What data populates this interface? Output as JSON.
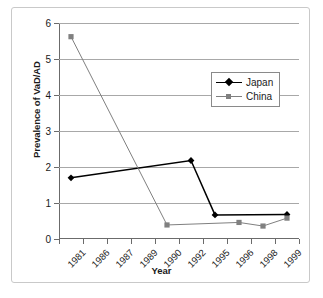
{
  "chart_data": {
    "type": "line",
    "title": "",
    "xlabel": "Year",
    "ylabel": "Prevalence of VaD/AD",
    "categories": [
      "1981",
      "1986",
      "1987",
      "1989",
      "1990",
      "1992",
      "1995",
      "1996",
      "1998",
      "1999"
    ],
    "ylim": [
      0,
      6
    ],
    "yticks": [
      "0",
      "1",
      "2",
      "3",
      "4",
      "5",
      "6"
    ],
    "grid": true,
    "legend_position": "upper-right-inside",
    "series": [
      {
        "name": "Japan",
        "marker": "diamond",
        "color": "#000000",
        "points": [
          {
            "x": "1981",
            "y": 1.7
          },
          {
            "x": "1992",
            "y": 2.18
          },
          {
            "x": "1995",
            "y": 0.67
          },
          {
            "x": "1999",
            "y": 0.68
          }
        ]
      },
      {
        "name": "China",
        "marker": "square",
        "color": "#808080",
        "points": [
          {
            "x": "1981",
            "y": 5.62
          },
          {
            "x": "1990",
            "y": 0.39
          },
          {
            "x": "1996",
            "y": 0.46
          },
          {
            "x": "1998",
            "y": 0.36
          },
          {
            "x": "1999",
            "y": 0.58
          }
        ]
      }
    ]
  },
  "axes": {
    "y_title": "Prevalence of VaD/AD",
    "x_title": "Year"
  },
  "legend": {
    "entries": [
      {
        "label": "Japan"
      },
      {
        "label": "China"
      }
    ]
  }
}
